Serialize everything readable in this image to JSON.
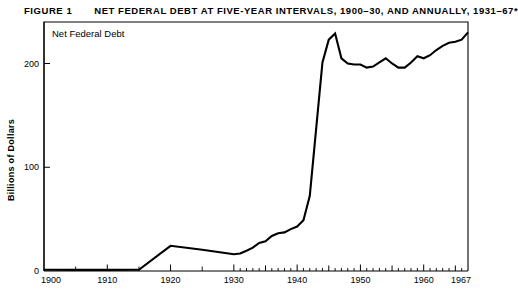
{
  "figure": {
    "label": "FIGURE 1",
    "title": "NET FEDERAL DEBT AT FIVE-YEAR INTERVALS, 1900–30, AND ANNUALLY, 1931–67*"
  },
  "chart_data": {
    "type": "line",
    "title": "NET FEDERAL DEBT AT FIVE-YEAR INTERVALS, 1900–30, AND ANNUALLY, 1931–67*",
    "series_label": "Net Federal Debt",
    "xlabel": "",
    "ylabel": "Billions of Dollars",
    "xlim": [
      1900,
      1967
    ],
    "ylim": [
      0,
      240
    ],
    "grid": false,
    "legend": "none",
    "x_ticks": [
      1900,
      1910,
      1920,
      1930,
      1940,
      1950,
      1960,
      1967
    ],
    "x_tick_labels": [
      "1900",
      "1910",
      "1920",
      "1930",
      "1940",
      "1950",
      "1960",
      "1967"
    ],
    "x_minor_ticks_5yr": [
      1905,
      1915,
      1925
    ],
    "x_minor_ticks_annual": [
      1931,
      1932,
      1933,
      1934,
      1936,
      1937,
      1938,
      1939,
      1941,
      1942,
      1943,
      1944,
      1946,
      1947,
      1948,
      1949,
      1951,
      1952,
      1953,
      1954,
      1956,
      1957,
      1958,
      1959,
      1961,
      1962,
      1963,
      1964,
      1966
    ],
    "x_mid_ticks": [
      1935,
      1945,
      1955,
      1965
    ],
    "y_ticks": [
      0,
      100,
      200
    ],
    "y_tick_labels": [
      "0",
      "100",
      "200"
    ],
    "series": [
      {
        "name": "Net Federal Debt",
        "x": [
          1900,
          1905,
          1910,
          1915,
          1920,
          1925,
          1930,
          1931,
          1932,
          1933,
          1934,
          1935,
          1936,
          1937,
          1938,
          1939,
          1940,
          1941,
          1942,
          1943,
          1944,
          1945,
          1946,
          1947,
          1948,
          1949,
          1950,
          1951,
          1952,
          1953,
          1954,
          1955,
          1956,
          1957,
          1958,
          1959,
          1960,
          1961,
          1962,
          1963,
          1964,
          1965,
          1966,
          1967
        ],
        "values": [
          1.2,
          1.1,
          1.1,
          1.2,
          24.3,
          20.5,
          16.2,
          16.8,
          19.5,
          22.5,
          27.1,
          28.7,
          33.8,
          36.4,
          37.2,
          40.4,
          42.9,
          48.9,
          72.4,
          136.7,
          201.0,
          223.0,
          229.0,
          205.0,
          200.0,
          199.0,
          199.0,
          196.0,
          197.0,
          201.0,
          205.0,
          200.0,
          196.0,
          196.0,
          201.0,
          207.0,
          205.0,
          208.0,
          213.0,
          217.0,
          220.0,
          221.0,
          223.0,
          230.0
        ]
      }
    ],
    "peak": {
      "year": 1946,
      "value": 229.0
    },
    "note": "Values in billions of dollars"
  }
}
